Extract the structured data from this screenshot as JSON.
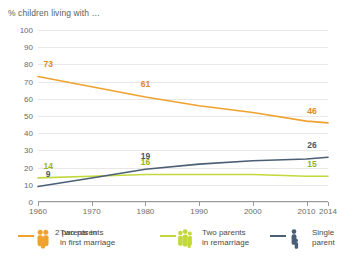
{
  "chart_data": {
    "type": "line",
    "title": "% children living with …",
    "xlabel": "",
    "ylabel": "",
    "x": [
      1960,
      1970,
      1980,
      1990,
      2000,
      2010,
      2014
    ],
    "xtick_labels": [
      "1960",
      "1970",
      "1980",
      "1990",
      "2000",
      "2010",
      "2014"
    ],
    "ytick_labels": [
      "0",
      "10",
      "20",
      "30",
      "40",
      "50",
      "60",
      "70",
      "80",
      "90",
      "100"
    ],
    "ylim": [
      0,
      100
    ],
    "xlim": [
      1960,
      2014
    ],
    "ystep": 10,
    "grid": true,
    "legend_position": "bottom",
    "series": [
      {
        "name": "Two parents in first marriage",
        "color": "#f0a22e",
        "values": [
          73,
          67,
          61,
          56,
          52,
          47,
          46
        ],
        "point_labels": [
          {
            "x": 1960,
            "y": 73,
            "text": "73"
          },
          {
            "x": 1980,
            "y": 61,
            "text": "61"
          },
          {
            "x": 2014,
            "y": 46,
            "text": "46"
          }
        ]
      },
      {
        "name": "Two parents in remarriage",
        "color": "#c3d83c",
        "values": [
          14,
          15,
          16,
          16,
          16,
          15,
          15
        ],
        "point_labels": [
          {
            "x": 1960,
            "y": 14,
            "text": "14"
          },
          {
            "x": 1980,
            "y": 16,
            "text": "16"
          },
          {
            "x": 2014,
            "y": 15,
            "text": "15"
          }
        ]
      },
      {
        "name": "Single parent",
        "color": "#4a5f75",
        "values": [
          9,
          14,
          19,
          22,
          24,
          25,
          26
        ],
        "point_labels": [
          {
            "x": 1960,
            "y": 9,
            "text": "9"
          },
          {
            "x": 1980,
            "y": 19,
            "text": "19"
          },
          {
            "x": 2014,
            "y": 26,
            "text": "26"
          }
        ]
      }
    ]
  },
  "legend": {
    "items": [
      {
        "overlay_label": "2 parents in",
        "label_line1": "Two parents",
        "label_line2": "in first marriage",
        "color": "#f0a22e",
        "icon": "family-two-parents-icon"
      },
      {
        "label_line1": "Two parents",
        "label_line2": "in remarriage",
        "color": "#c3d83c",
        "icon": "family-remarriage-icon"
      },
      {
        "label_line1": "Single",
        "label_line2": "parent",
        "color": "#4a5f75",
        "icon": "family-single-parent-icon"
      }
    ]
  },
  "colors": {
    "orange": "#f0a22e",
    "green": "#c3d83c",
    "blue": "#4a5f75",
    "grid": "#e8e8e8",
    "axis": "#9a9a9a",
    "text": "#4a4a4a"
  }
}
